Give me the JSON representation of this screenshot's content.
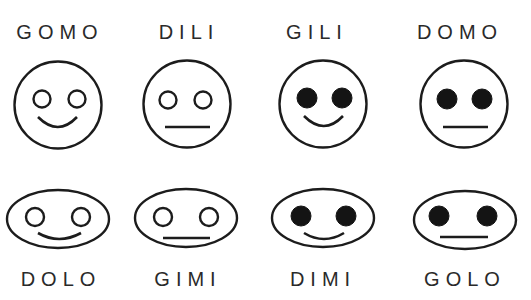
{
  "colors": {
    "background": "#ffffff",
    "stroke": "#1c1c1c",
    "label": "#2a2a2a"
  },
  "rows": [
    {
      "row": "top",
      "shape": "circle",
      "faces": [
        {
          "name": "GOMO",
          "eyes": "open",
          "mouth": "smile"
        },
        {
          "name": "DILI",
          "eyes": "open",
          "mouth": "straight"
        },
        {
          "name": "GILI",
          "eyes": "filled",
          "mouth": "smile"
        },
        {
          "name": "DOMO",
          "eyes": "filled",
          "mouth": "straight"
        }
      ]
    },
    {
      "row": "bottom",
      "shape": "oval",
      "faces": [
        {
          "name": "DOLO",
          "eyes": "open",
          "mouth": "smile"
        },
        {
          "name": "GIMI",
          "eyes": "open",
          "mouth": "straight"
        },
        {
          "name": "DIMI",
          "eyes": "filled",
          "mouth": "smile"
        },
        {
          "name": "GOLO",
          "eyes": "filled",
          "mouth": "straight"
        }
      ]
    }
  ]
}
